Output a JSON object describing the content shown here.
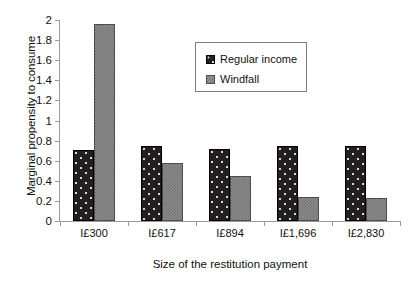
{
  "chart_data": {
    "type": "bar",
    "title": "",
    "xlabel": "Size of the restitution payment",
    "ylabel": "Marginal propensity to consume",
    "categories": [
      "I£300",
      "I£617",
      "I£894",
      "I£1,696",
      "I£2,830"
    ],
    "series": [
      {
        "name": "Regular income",
        "values": [
          0.71,
          0.75,
          0.72,
          0.75,
          0.75
        ],
        "color": "#231f20",
        "pattern": "dark-dotted"
      },
      {
        "name": "Windfall",
        "values": [
          1.96,
          0.58,
          0.45,
          0.24,
          0.23
        ],
        "color": "#8e8e8e",
        "pattern": "gray-checkered"
      }
    ],
    "ylim": [
      0,
      2
    ],
    "yticks": [
      0,
      0.2,
      0.4,
      0.6,
      0.8,
      1,
      1.2,
      1.4,
      1.6,
      1.8,
      2
    ],
    "ytick_labels": [
      "0",
      "0.2",
      "0.4",
      "0.6",
      "0.8",
      "1",
      "1.2",
      "1.4",
      "1.6",
      "1.8",
      "2"
    ],
    "grid": false,
    "legend_position": "upper-center",
    "axis_color": "#9a9a9a",
    "background": "#ffffff"
  }
}
